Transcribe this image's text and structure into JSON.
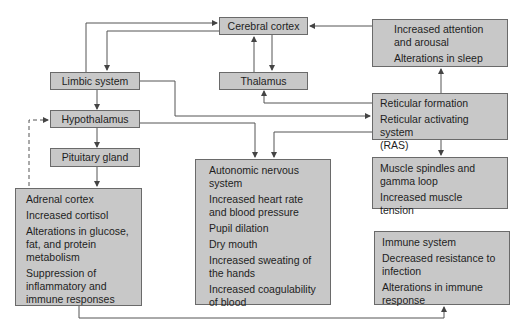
{
  "diagram": {
    "colors": {
      "box_fill": "#c8c8c8",
      "box_border": "#6a6a6a",
      "line": "#555555",
      "text": "#1e1e1e"
    },
    "nodes": {
      "cerebral_cortex": {
        "label": "Cerebral cortex"
      },
      "thalamus": {
        "label": "Thalamus"
      },
      "limbic_system": {
        "label": "Limbic system"
      },
      "hypothalamus": {
        "label": "Hypothalamus"
      },
      "pituitary_gland": {
        "label": "Pituitary gland"
      },
      "attention": {
        "lines": [
          "Increased attention\nand arousal",
          "Alterations in sleep"
        ]
      },
      "reticular": {
        "lines": [
          "Reticular formation",
          "Reticular activating system\n(RAS)"
        ]
      },
      "muscle": {
        "lines": [
          "Muscle spindles and\ngamma loop",
          "Increased muscle\ntension"
        ]
      },
      "adrenal": {
        "lines": [
          "Adrenal cortex",
          "Increased cortisol",
          "Alterations in glucose,\nfat, and protein\nmetabolism",
          "Suppression of\ninflammatory and\nimmune responses"
        ]
      },
      "autonomic": {
        "lines": [
          "Autonomic nervous\nsystem",
          "Increased heart rate\nand blood pressure",
          "Pupil dilation",
          "Dry mouth",
          "Increased sweating of\nthe hands",
          "Increased coagulability\nof blood"
        ]
      },
      "immune": {
        "lines": [
          "Immune system",
          "Decreased resistance to\ninfection",
          "Alterations in immune\nresponse"
        ]
      }
    },
    "edges": [
      {
        "from": "limbic_system",
        "to": "cerebral_cortex"
      },
      {
        "from": "cerebral_cortex",
        "to": "limbic_system"
      },
      {
        "from": "thalamus",
        "to": "cerebral_cortex"
      },
      {
        "from": "cerebral_cortex",
        "to": "thalamus"
      },
      {
        "from": "attention",
        "to": "cerebral_cortex"
      },
      {
        "from": "reticular",
        "to": "attention"
      },
      {
        "from": "reticular",
        "to": "thalamus"
      },
      {
        "from": "limbic_system",
        "to": "reticular"
      },
      {
        "from": "limbic_system",
        "to": "hypothalamus"
      },
      {
        "from": "hypothalamus",
        "to": "pituitary_gland"
      },
      {
        "from": "pituitary_gland",
        "to": "adrenal"
      },
      {
        "from": "adrenal",
        "to": "hypothalamus",
        "style": "dashed"
      },
      {
        "from": "hypothalamus",
        "to": "autonomic"
      },
      {
        "from": "reticular",
        "to": "autonomic"
      },
      {
        "from": "reticular",
        "to": "muscle"
      },
      {
        "from": "adrenal",
        "to": "immune"
      }
    ]
  }
}
